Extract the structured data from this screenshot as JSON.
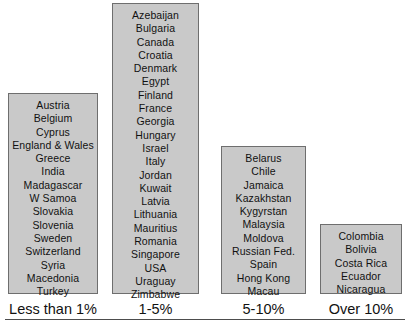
{
  "figure": {
    "title": "",
    "axis_rule_color": "#4d4d4d",
    "box_fill_color": "#c9c9c9",
    "box_border_color": "#6e6e6e",
    "text_color": "#111111"
  },
  "chart_data": {
    "type": "table",
    "title": "",
    "xlabel": "",
    "ylabel": "",
    "legend": [],
    "categories": [
      "Less than 1%",
      "1-5%",
      "5-10%",
      "Over 10%"
    ],
    "values": [
      14,
      22,
      11,
      5
    ],
    "groups": [
      {
        "label": "Less than 1%",
        "count": 14,
        "items": [
          "Austria",
          "Belgium",
          "Cyprus",
          "England & Wales",
          "Greece",
          "India",
          "Madagascar",
          "W Samoa",
          "Slovakia",
          "Slovenia",
          "Sweden",
          "Switzerland",
          "Syria",
          "Macedonia",
          "Turkey"
        ]
      },
      {
        "label": "1-5%",
        "count": 22,
        "items": [
          "Azebaijan",
          "Bulgaria",
          "Canada",
          "Croatia",
          "Denmark",
          "Egypt",
          "Finland",
          "France",
          "Georgia",
          "Hungary",
          "Israel",
          "Italy",
          "Jordan",
          "Kuwait",
          "Latvia",
          "Lithuania",
          "Mauritius",
          "Romania",
          "Singapore",
          "USA",
          "Uraguay",
          "Zimbabwe"
        ]
      },
      {
        "label": "5-10%",
        "count": 11,
        "items": [
          "Belarus",
          "Chile",
          "Jamaica",
          "Kazakhstan",
          "Kygyrstan",
          "Malaysia",
          "Moldova",
          "Russian Fed.",
          "Spain",
          "Hong Kong",
          "Macau"
        ]
      },
      {
        "label": "Over 10%",
        "count": 5,
        "items": [
          "Colombia",
          "Bolivia",
          "Costa Rica",
          "Ecuador",
          "Nicaragua"
        ]
      }
    ]
  }
}
